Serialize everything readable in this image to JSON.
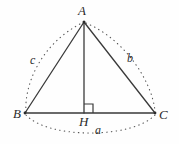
{
  "figure": {
    "kind": "geometry-diagram",
    "background_color": "#fefefe",
    "stroke_color": "#3a3a3a",
    "dotted_color": "#555555",
    "vertices": [
      {
        "id": "A",
        "label": "A",
        "x": 84,
        "y": 22
      },
      {
        "id": "B",
        "label": "B",
        "x": 25,
        "y": 113
      },
      {
        "id": "C",
        "label": "C",
        "x": 155,
        "y": 113
      },
      {
        "id": "H",
        "label": "H",
        "x": 84,
        "y": 113
      }
    ],
    "segments": [
      {
        "name": "side-AB",
        "from": "A",
        "to": "B"
      },
      {
        "name": "side-AC",
        "from": "A",
        "to": "C"
      },
      {
        "name": "side-BC",
        "from": "B",
        "to": "C"
      },
      {
        "name": "altitude-AH",
        "from": "A",
        "to": "H"
      }
    ],
    "side_labels": [
      {
        "id": "a",
        "label": "a",
        "opposite_vertex": "A",
        "spans": "B to C",
        "x": 99,
        "y": 130
      },
      {
        "id": "b",
        "label": "b",
        "opposite_vertex": "B",
        "spans": "A to C",
        "x": 131,
        "y": 58
      },
      {
        "id": "c",
        "label": "c",
        "opposite_vertex": "C",
        "spans": "A to B",
        "x": 34,
        "y": 60
      }
    ],
    "right_angle": {
      "name": "right-angle-at-H",
      "vertex": "H",
      "size": 9,
      "orientation": "upper-right"
    },
    "arcs": [
      {
        "name": "arc-c",
        "from": "B",
        "to": "A",
        "bulge": "outward-left",
        "style": "dotted"
      },
      {
        "name": "arc-b",
        "from": "A",
        "to": "C",
        "bulge": "outward-right",
        "style": "dotted"
      },
      {
        "name": "arc-a",
        "from": "B",
        "to": "C",
        "bulge": "outward-down",
        "style": "dotted"
      }
    ]
  }
}
